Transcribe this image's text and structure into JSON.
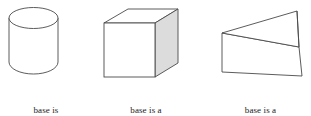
{
  "figure": {
    "background_color": "#ffffff",
    "stroke_color": "#4a4a4a",
    "face_fill": "#ffffff",
    "shaded_face_fill": "#dcdcdc",
    "text_color": "#1c1c1c"
  },
  "items": [
    {
      "shape_name": "cylinder",
      "caption_line1": "base is",
      "caption_line2": "a circle"
    },
    {
      "shape_name": "cube",
      "caption_line1": "base is a",
      "caption_line2": "rectangle"
    },
    {
      "shape_name": "triangular-prism",
      "caption_line1": "base is a",
      "caption_line2": "triangle"
    }
  ]
}
